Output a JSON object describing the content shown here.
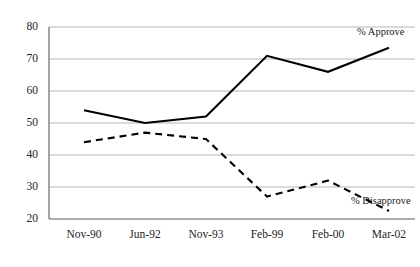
{
  "chart_data": {
    "type": "line",
    "title": "",
    "subtitle": "",
    "xlabel": "",
    "ylabel": "",
    "categories": [
      "Nov-90",
      "Jun-92",
      "Nov-93",
      "Feb-99",
      "Feb-00",
      "Mar-02"
    ],
    "series": [
      {
        "name": "% Approve",
        "style": "solid",
        "color": "#000000",
        "values": [
          54,
          50,
          52,
          71,
          66,
          73.5
        ],
        "label_text": "% Approve"
      },
      {
        "name": "% Disapprove",
        "style": "dashed",
        "color": "#000000",
        "values": [
          44,
          47,
          45,
          27,
          32,
          22.5
        ],
        "label_text": "% Disapprove"
      }
    ],
    "ylim": [
      20,
      80
    ],
    "yticks": [
      20,
      30,
      40,
      50,
      60,
      70,
      80
    ],
    "ytick_labels": [
      "20",
      "30",
      "40",
      "50",
      "60",
      "70",
      "80"
    ],
    "grid": true,
    "grid_axis": "y",
    "grid_color": "#b5b5b5",
    "axis_color": "#555555",
    "background": "#ffffff",
    "legend_position": "inline-right-of-series-end"
  },
  "labels": {
    "approve": "% Approve",
    "disapprove": "% Disapprove"
  }
}
